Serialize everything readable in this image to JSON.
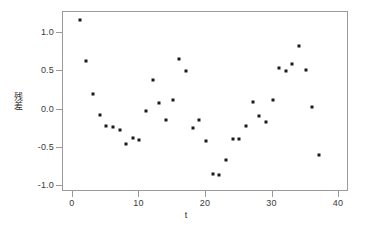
{
  "chart_data": {
    "type": "scatter",
    "title": "",
    "xlabel": "t",
    "ylabel": "残差",
    "xlim": [
      -1.5,
      41.5
    ],
    "ylim": [
      -1.08,
      1.28
    ],
    "xticks": [
      0,
      10,
      20,
      30,
      40
    ],
    "xtick_labels": [
      "0",
      "10",
      "20",
      "30",
      "40"
    ],
    "yticks": [
      -1.0,
      -0.5,
      0.0,
      0.5,
      1.0
    ],
    "ytick_labels": [
      "-1.0",
      "-0.5",
      "0.0",
      "0.5",
      "1.0"
    ],
    "grid": false,
    "legend": null,
    "marker": "filled-square",
    "marker_color": "#1a1a1a",
    "frame_color": "#9a9a9a",
    "background": "#ffffff",
    "x": [
      1,
      2,
      3,
      4,
      5,
      6,
      7,
      8,
      9,
      10,
      11,
      12,
      13,
      14,
      15,
      16,
      17,
      18,
      19,
      20,
      21,
      22,
      23,
      24,
      25,
      26,
      27,
      28,
      29,
      30,
      31,
      32,
      33,
      34,
      35,
      36,
      37
    ],
    "y": [
      1.17,
      0.64,
      0.2,
      -0.07,
      -0.21,
      -0.23,
      -0.27,
      -0.45,
      -0.37,
      -0.4,
      -0.02,
      0.39,
      0.09,
      -0.13,
      0.13,
      0.67,
      0.5,
      -0.24,
      -0.13,
      -0.41,
      -0.84,
      -0.86,
      -0.66,
      -0.38,
      -0.39,
      -0.22,
      0.1,
      -0.08,
      -0.16,
      0.12,
      0.54,
      0.5,
      0.6,
      0.83,
      0.52,
      0.03,
      -0.6
    ],
    "points": [
      {
        "t": 1,
        "r": 1.17
      },
      {
        "t": 2,
        "r": 0.64
      },
      {
        "t": 3,
        "r": 0.2
      },
      {
        "t": 4,
        "r": -0.07
      },
      {
        "t": 5,
        "r": -0.21
      },
      {
        "t": 6,
        "r": -0.23
      },
      {
        "t": 7,
        "r": -0.27
      },
      {
        "t": 8,
        "r": -0.45
      },
      {
        "t": 9,
        "r": -0.37
      },
      {
        "t": 10,
        "r": -0.4
      },
      {
        "t": 11,
        "r": -0.02
      },
      {
        "t": 12,
        "r": 0.39
      },
      {
        "t": 13,
        "r": 0.09
      },
      {
        "t": 14,
        "r": -0.13
      },
      {
        "t": 15,
        "r": 0.13
      },
      {
        "t": 16,
        "r": 0.67
      },
      {
        "t": 17,
        "r": 0.5
      },
      {
        "t": 18,
        "r": -0.24
      },
      {
        "t": 19,
        "r": -0.13
      },
      {
        "t": 20,
        "r": -0.41
      },
      {
        "t": 21,
        "r": -0.84
      },
      {
        "t": 22,
        "r": -0.86
      },
      {
        "t": 23,
        "r": -0.66
      },
      {
        "t": 24,
        "r": -0.38
      },
      {
        "t": 25,
        "r": -0.39
      },
      {
        "t": 26,
        "r": -0.22
      },
      {
        "t": 27,
        "r": 0.1
      },
      {
        "t": 28,
        "r": -0.08
      },
      {
        "t": 29,
        "r": -0.16
      },
      {
        "t": 30,
        "r": 0.12
      },
      {
        "t": 31,
        "r": 0.54
      },
      {
        "t": 32,
        "r": 0.5
      },
      {
        "t": 33,
        "r": 0.6
      },
      {
        "t": 34,
        "r": 0.83
      },
      {
        "t": 35,
        "r": 0.52
      },
      {
        "t": 36,
        "r": 0.03
      },
      {
        "t": 37,
        "r": -0.6
      }
    ]
  }
}
